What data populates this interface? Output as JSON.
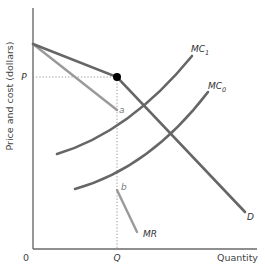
{
  "diagram": {
    "title": "",
    "y_axis_label": "Price and cost (dollars)",
    "x_axis_label": "Quantity",
    "origin_label": "0",
    "price_label": "P",
    "quantity_label": "Q",
    "point_a_label": "a",
    "point_b_label": "b",
    "kink_marker": "kinked-demand-point",
    "curves": [
      {
        "id": "D",
        "label": "D",
        "description": "Kinked demand curve"
      },
      {
        "id": "MR",
        "label": "MR",
        "description": "Marginal revenue (with gap between a and b)"
      },
      {
        "id": "MC1",
        "label": "MC",
        "subscript": "1",
        "description": "Marginal cost curve 1 (higher)"
      },
      {
        "id": "MC0",
        "label": "MC",
        "subscript": "0",
        "description": "Marginal cost curve 0 (lower)"
      }
    ],
    "colors": {
      "demand": "#666666",
      "mc": "#666666",
      "mr": "#9a9a9a",
      "axis": "#6a6a6a",
      "guide": "#8a8a8a",
      "kink_dot": "#000000"
    }
  },
  "labels": {
    "mc1_main": "MC",
    "mc1_sub": "1",
    "mc0_main": "MC",
    "mc0_sub": "0",
    "d": "D",
    "mr": "MR"
  }
}
